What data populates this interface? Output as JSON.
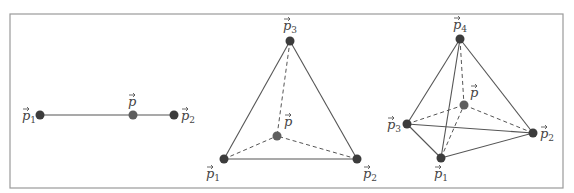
{
  "colors": {
    "frame": "#9a9a9a",
    "edge": "#555555",
    "vertex": "#3c3c3c",
    "interior_point": "#5e5e5e",
    "label": "#444444"
  },
  "panels": [
    {
      "name": "segment-1d",
      "vertices": [
        {
          "label": "p",
          "sub": "1",
          "x": 40,
          "y": 115,
          "lx": 22,
          "ly": 120
        },
        {
          "label": "p",
          "sub": "2",
          "x": 174,
          "y": 115,
          "lx": 181,
          "ly": 120
        }
      ],
      "point": {
        "label": "p",
        "x": 133,
        "y": 115,
        "lx": 128,
        "ly": 106
      },
      "solid_edges": [
        [
          0,
          1
        ]
      ],
      "dashed_edges": []
    },
    {
      "name": "triangle-2d",
      "vertices": [
        {
          "label": "p",
          "sub": "1",
          "x": 224,
          "y": 159,
          "lx": 206,
          "ly": 178
        },
        {
          "label": "p",
          "sub": "2",
          "x": 357,
          "y": 159,
          "lx": 363,
          "ly": 178
        },
        {
          "label": "p",
          "sub": "3",
          "x": 290,
          "y": 41,
          "lx": 283,
          "ly": 30
        }
      ],
      "point": {
        "label": "p",
        "x": 277,
        "y": 136,
        "lx": 284,
        "ly": 126
      },
      "solid_edges": [
        [
          0,
          1
        ],
        [
          1,
          2
        ],
        [
          2,
          0
        ]
      ],
      "dashed_edges": [
        [
          0,
          "p"
        ],
        [
          1,
          "p"
        ],
        [
          2,
          "p"
        ]
      ]
    },
    {
      "name": "tetrahedron-3d",
      "vertices": [
        {
          "label": "p",
          "sub": "1",
          "x": 441,
          "y": 158,
          "lx": 434,
          "ly": 178
        },
        {
          "label": "p",
          "sub": "2",
          "x": 533,
          "y": 133,
          "lx": 540,
          "ly": 138
        },
        {
          "label": "p",
          "sub": "3",
          "x": 407,
          "y": 124,
          "lx": 387,
          "ly": 129
        },
        {
          "label": "p",
          "sub": "4",
          "x": 460,
          "y": 39,
          "lx": 453,
          "ly": 29
        }
      ],
      "point": {
        "label": "p",
        "x": 464,
        "y": 105,
        "lx": 470,
        "ly": 97
      },
      "solid_edges": [
        [
          0,
          1
        ],
        [
          0,
          2
        ],
        [
          0,
          3
        ],
        [
          1,
          2
        ],
        [
          1,
          3
        ],
        [
          2,
          3
        ]
      ],
      "dashed_edges": [
        [
          0,
          "p"
        ],
        [
          1,
          "p"
        ],
        [
          2,
          "p"
        ],
        [
          3,
          "p"
        ]
      ]
    }
  ],
  "frame": {
    "x": 10,
    "y": 14,
    "width": 553,
    "height": 174
  }
}
